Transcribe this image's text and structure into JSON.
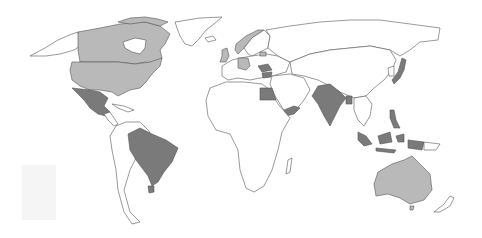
{
  "map": {
    "type": "choropleth-world",
    "projection": "Miller-like cylindrical",
    "background": "#ffffff",
    "border_color": "#555555",
    "categories": [
      {
        "name": "light",
        "color": "#b9b9b9",
        "countries": [
          "United States",
          "Canada",
          "Australia",
          "United Kingdom",
          "Germany",
          "Norway",
          "Lithuania"
        ]
      },
      {
        "name": "dark",
        "color": "#7a7a7a",
        "countries": [
          "Mexico",
          "Brazil",
          "Uruguay",
          "Egypt",
          "Yemen",
          "India",
          "Bangladesh",
          "Japan",
          "Philippines",
          "Indonesia",
          "Romania",
          "Bulgaria"
        ]
      },
      {
        "name": "none",
        "color": "#ffffff",
        "countries": [
          "All other countries"
        ]
      }
    ]
  }
}
